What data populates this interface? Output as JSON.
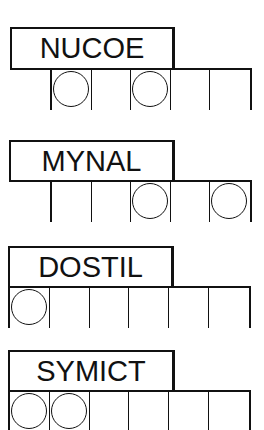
{
  "puzzles": [
    {
      "scrambled": "NUCOE",
      "cells": 5,
      "circled": [
        1,
        3
      ]
    },
    {
      "scrambled": "MYNAL",
      "cells": 5,
      "circled": [
        3,
        5
      ]
    },
    {
      "scrambled": "DOSTIL",
      "cells": 6,
      "circled": [
        1
      ]
    },
    {
      "scrambled": "SYMICT",
      "cells": 6,
      "circled": [
        1,
        2
      ]
    }
  ],
  "colors": {
    "ink": "#111111",
    "paper": "#ffffff"
  }
}
